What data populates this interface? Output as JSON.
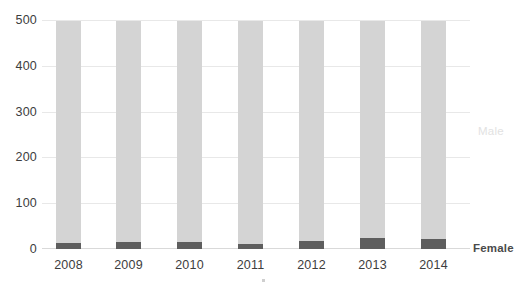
{
  "chart_data": {
    "type": "bar",
    "stacked": true,
    "title": "",
    "subtitle": "",
    "xlabel": "",
    "ylabel": "",
    "categories": [
      "2008",
      "2009",
      "2010",
      "2011",
      "2012",
      "2013",
      "2014"
    ],
    "series": [
      {
        "name": "Female",
        "color": "#5e5e5e",
        "values": [
          13,
          16,
          15,
          12,
          18,
          25,
          23
        ]
      },
      {
        "name": "Male",
        "color": "#d4d4d4",
        "values": [
          487,
          484,
          485,
          488,
          482,
          475,
          477
        ]
      }
    ],
    "totals": [
      500,
      500,
      500,
      500,
      500,
      500,
      500
    ],
    "ylim": [
      0,
      500
    ],
    "y_ticks": [
      0,
      100,
      200,
      300,
      400,
      500
    ],
    "y_tick_labels": [
      "0",
      "100",
      "200",
      "300",
      "400",
      "500"
    ],
    "grid": true,
    "grid_axis": "y",
    "legend_position": "right-inline",
    "legend": [
      "Male",
      "Female"
    ]
  },
  "axis": {
    "y_labels": [
      "500",
      "400",
      "300",
      "200",
      "100",
      "0"
    ],
    "x_labels": [
      "2008",
      "2009",
      "2010",
      "2011",
      "2012",
      "2013",
      "2014"
    ]
  },
  "labels": {
    "male": "Male",
    "female": "Female"
  },
  "colors": {
    "male_fill": "#d4d4d4",
    "female_fill": "#5e5e5e",
    "gridline": "#e8e8e8",
    "text": "#3d3d3d",
    "male_label_text": "#e2e2e2",
    "female_label_text": "#4a4a4a",
    "background": "#ffffff"
  }
}
